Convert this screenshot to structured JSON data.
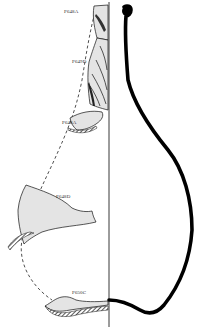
{
  "figure": {
    "colors": {
      "background": "#ffffff",
      "sherd_fill": "#e4e4e4",
      "outline": "#111111",
      "profile": "#000000"
    },
    "sherds": [
      {
        "id": "sherd-1",
        "label": "P648A"
      },
      {
        "id": "sherd-2",
        "label": "P649D"
      },
      {
        "id": "sherd-3",
        "label": "P648A"
      },
      {
        "id": "sherd-4",
        "label": "P648D"
      },
      {
        "id": "sherd-5",
        "label": "P650C"
      }
    ]
  }
}
